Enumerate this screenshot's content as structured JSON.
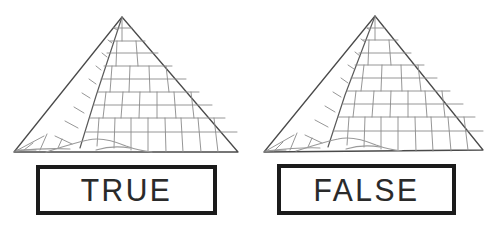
{
  "figure": {
    "colors": {
      "background": "#ffffff",
      "outline": "#4a4a4a",
      "grid": "#8a8a8a",
      "sand": "#9a9a9a",
      "box_border": "#1b1b1b",
      "label_text": "#2a2a2a"
    }
  },
  "panels": [
    {
      "id": "true-panel",
      "icon_name": "pyramid-icon",
      "label": "TRUE"
    },
    {
      "id": "false-panel",
      "icon_name": "pyramid-icon",
      "label": "FALSE"
    }
  ]
}
